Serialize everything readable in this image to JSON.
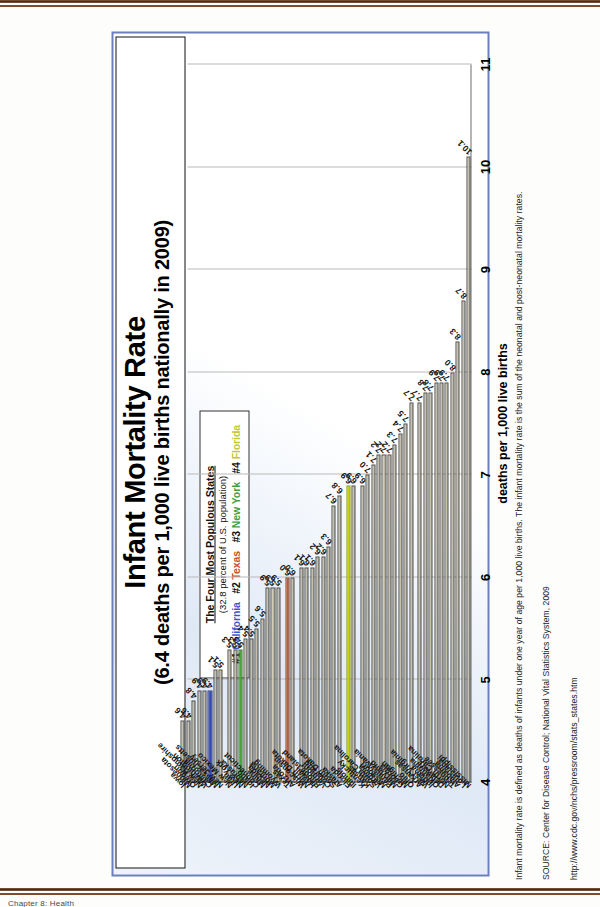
{
  "page": {
    "footer_caption": "Chapter 8: Health"
  },
  "slide": {
    "title_line1": "Infant Mortality Rate",
    "title_line2": "(6.4 deaths per 1,000 live births nationally in 2009)",
    "legend": {
      "heading": "The Four Most Populous States",
      "subheading": "(32.8 percent of U.S. population)",
      "entries": [
        {
          "rank": "#1",
          "name": "California",
          "color": "#3a57c8"
        },
        {
          "rank": "#2",
          "name": "Texas",
          "color": "#c8502a"
        },
        {
          "rank": "#3",
          "name": "New York",
          "color": "#3f9f3f"
        },
        {
          "rank": "#4",
          "name": "Florida",
          "color": "#c3c734"
        }
      ]
    },
    "notes": [
      "Infant mortality rate is defined as deaths of infants under one year of age per 1,000 live births.  The infant mortality rate is the sum of the neonatal and post-neonatal mortality rates.",
      "SOURCE: Center for Disease Control; National Vital Statistics System, 2009",
      "http://www.cdc.gov/nchs/pressroom/stats_states.htm"
    ]
  },
  "chart_data": {
    "type": "bar",
    "orientation": "horizontal",
    "title": "Infant Mortality Rate",
    "subtitle": "(6.4 deaths per 1,000 live births nationally in 2009)",
    "xlabel": "deaths per 1,000 live births",
    "ylabel": "",
    "xlim": [
      4,
      11
    ],
    "xticks": [
      4,
      5,
      6,
      7,
      8,
      9,
      10,
      11
    ],
    "grid": true,
    "legend_position": "top-left",
    "categories": [
      "Mississippi",
      "Louisiana",
      "Alabama",
      "Tennessee",
      "North Carolina",
      "Delaware",
      "Oklahoma",
      "Indiana",
      "West Virginia",
      "Arkansas",
      "Ohio",
      "Michigan",
      "Georgia",
      "Maryland",
      "Pennsylvania",
      "Missouri",
      "Virginia",
      "South Carolina",
      "Kansas",
      "Kentucky",
      "Illinois",
      "Florida",
      "Alaska",
      "South Dakota",
      "Colorado",
      "Vermont",
      "Rhode Island",
      "Hawaii",
      "North Dakota",
      "Wisconsin",
      "Arizona",
      "Texas",
      "Wyoming",
      "Montana",
      "Nevada",
      "Maine",
      "Connecticut",
      "Idaho",
      "Nebraska",
      "New York",
      "Utah",
      "New Mexico",
      "New Jersey",
      "Massachusetts",
      "California",
      "Washington",
      "New Hampshire",
      "Oregon",
      "Minnesota",
      "Iowa"
    ],
    "values": [
      10.1,
      8.7,
      8.3,
      8.0,
      7.9,
      7.9,
      7.9,
      7.8,
      7.8,
      7.7,
      7.7,
      7.5,
      7.4,
      7.3,
      7.2,
      7.2,
      7.2,
      7.1,
      7.0,
      6.9,
      6.9,
      6.9,
      6.8,
      6.7,
      6.3,
      6.2,
      6.2,
      6.1,
      6.1,
      6.1,
      6.0,
      6.0,
      5.9,
      5.9,
      5.9,
      5.6,
      5.5,
      5.4,
      5.4,
      5.3,
      5.3,
      5.3,
      5.1,
      5.1,
      4.9,
      4.9,
      4.9,
      4.8,
      4.6,
      4.6
    ],
    "value_labels": [
      "10.1",
      "8.7",
      "8.3",
      "8.0",
      "7.9",
      "7.9",
      "7.9",
      "7.8",
      "7.8",
      "7.7",
      "7.7",
      "7.5",
      "7.4",
      "7.3",
      "7.2",
      "7.2",
      "7.2",
      "7.1",
      "7.0",
      "6.9",
      "6.9",
      "6.9",
      "6.8",
      "6.7",
      "6.3",
      "6.2",
      "6.2",
      "6.1",
      "6.1",
      "6.1",
      "6.0",
      "6.0",
      "5.9",
      "5.9",
      "5.9",
      "5.6",
      "5.5",
      "5.4",
      "5.4",
      "5.3",
      "5.3",
      "5.3",
      "5.1",
      "5.1",
      "4.9",
      "4.9",
      "4.9",
      "4.8",
      "4.6",
      "4.6"
    ],
    "highlight": {
      "California": "#3a4fbe",
      "Texas": "#cf5c2c",
      "New York": "#4aab3c",
      "Florida": "#cdd418"
    },
    "default_bar_color": "#cdc8b4"
  }
}
